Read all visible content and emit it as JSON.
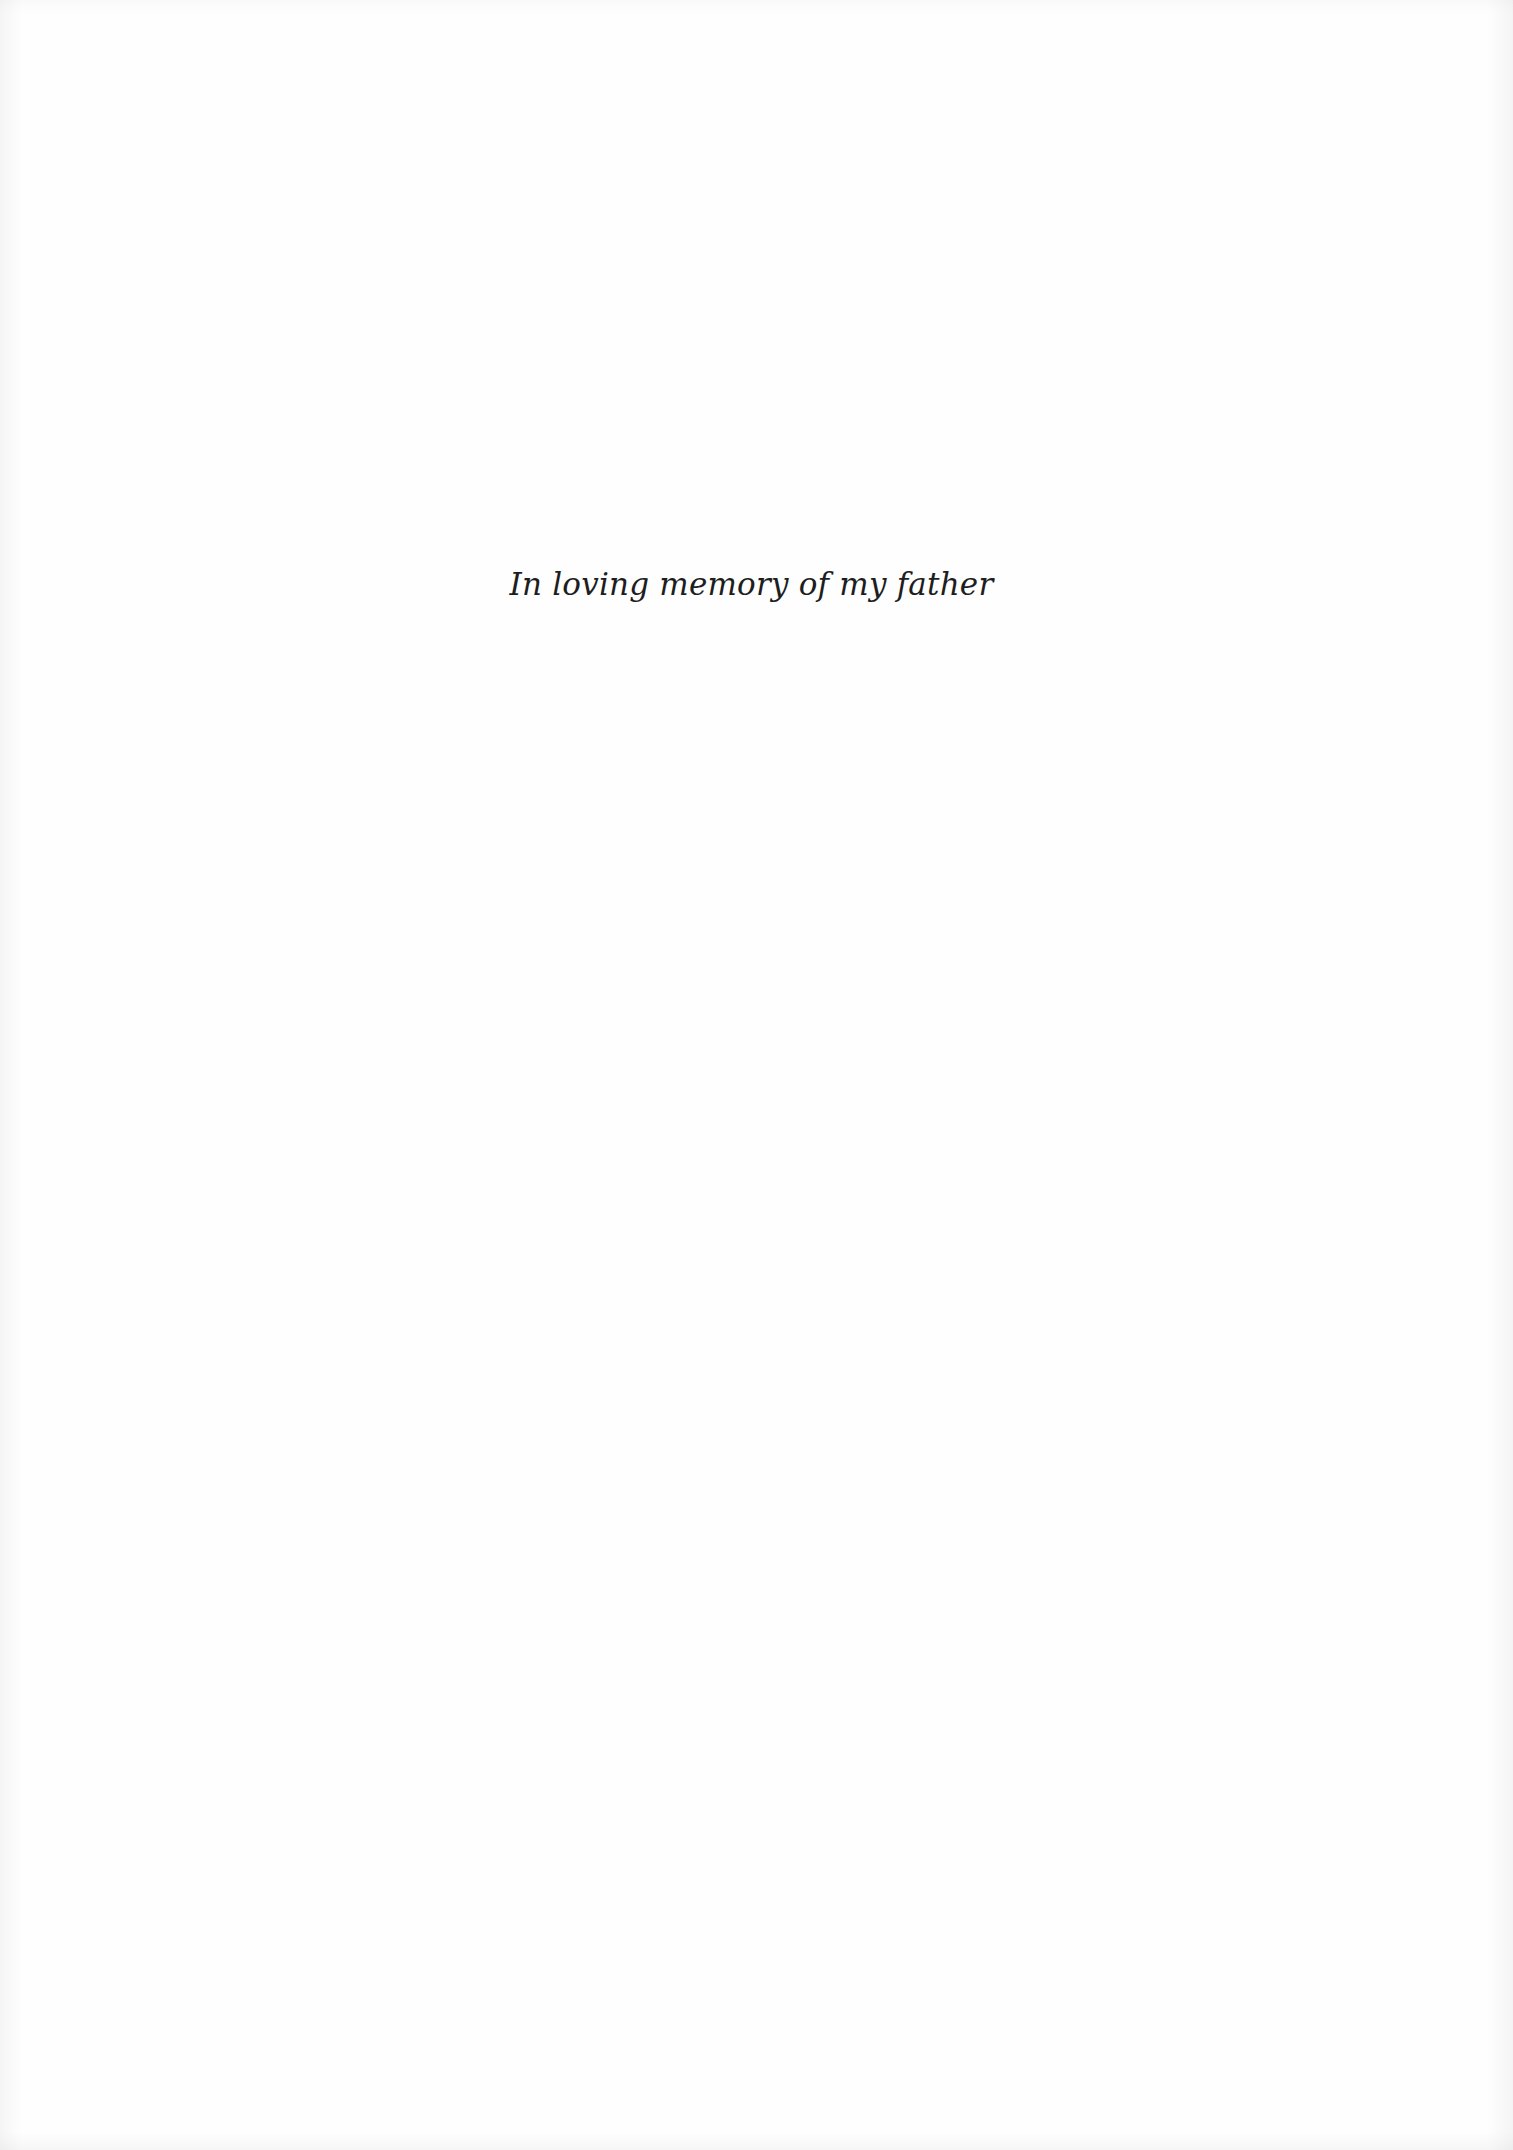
{
  "page": {
    "type": "dedication",
    "dedication_text": "In loving memory of my father",
    "colors": {
      "background": "#fefefe",
      "text": "#1e1e1e"
    }
  }
}
